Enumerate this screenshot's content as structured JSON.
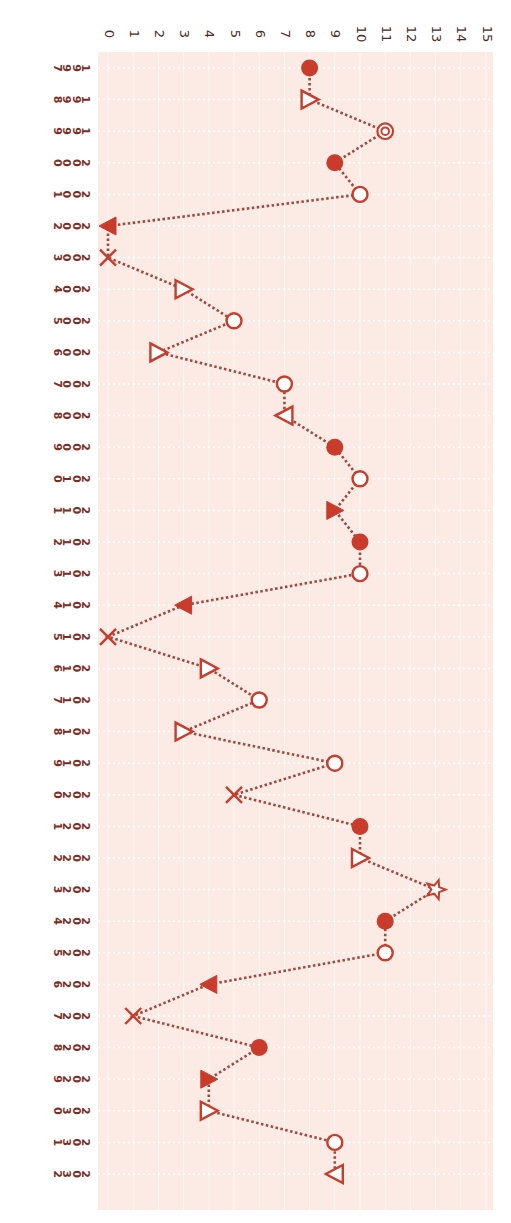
{
  "chart_data": {
    "type": "line",
    "orientation": "rotated-90-clockwise",
    "title": "",
    "xlabel": "",
    "ylabel": "",
    "ylim": [
      0,
      15
    ],
    "y_ticks": [
      0,
      1,
      2,
      3,
      4,
      5,
      6,
      7,
      8,
      9,
      10,
      11,
      12,
      13,
      14,
      15
    ],
    "grid": true,
    "legend": null,
    "line_style": "dotted",
    "colors": {
      "marker": "#c93b2b",
      "line": "#a0483e",
      "plot_bg": "#fbebe4",
      "grid": "#ffffff",
      "tick_text": "#4a2a24",
      "year_text": "#7a2e26"
    },
    "x": [
      "1997",
      "1998",
      "1999",
      "2000",
      "2001",
      "2002",
      "2003",
      "2004",
      "2005",
      "2006",
      "2007",
      "2008",
      "2009",
      "2010",
      "2011",
      "2012",
      "2013",
      "2014",
      "2015",
      "2016",
      "2017",
      "2018",
      "2019",
      "2020",
      "2021",
      "2022",
      "2023",
      "2024",
      "2025",
      "2026",
      "2027",
      "2028",
      "2029",
      "2030",
      "2031",
      "2032"
    ],
    "values": [
      8,
      8,
      11,
      9,
      10,
      0,
      0,
      3,
      5,
      2,
      7,
      7,
      9,
      10,
      9,
      10,
      10,
      3,
      0,
      4,
      6,
      3,
      9,
      5,
      10,
      10,
      13,
      11,
      11,
      4,
      1,
      6,
      4,
      4,
      9,
      9
    ],
    "markers": [
      "filled-circle",
      "open-triangle-right",
      "double-circle",
      "filled-circle",
      "open-circle",
      "filled-triangle-left",
      "x",
      "open-triangle-right",
      "open-circle",
      "open-triangle-right",
      "open-circle",
      "open-triangle-left",
      "filled-circle",
      "open-circle",
      "filled-triangle-right",
      "filled-circle",
      "open-circle",
      "filled-triangle-left",
      "x",
      "open-triangle-right",
      "open-circle",
      "open-triangle-right",
      "open-circle",
      "x",
      "filled-circle",
      "open-triangle-right",
      "open-star",
      "filled-circle",
      "open-circle",
      "filled-triangle-left",
      "x",
      "filled-circle",
      "filled-triangle-right",
      "open-triangle-right",
      "open-circle",
      "open-triangle-left"
    ]
  }
}
